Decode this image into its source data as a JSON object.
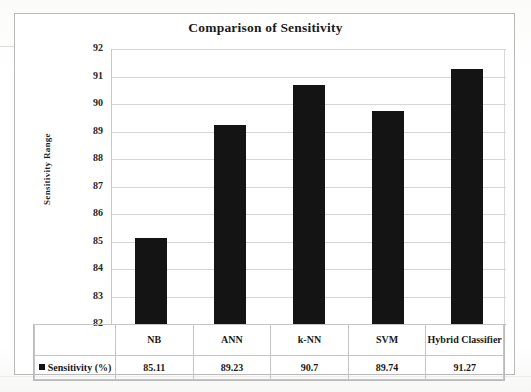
{
  "chart_data": {
    "type": "bar",
    "title": "Comparison of Sensitivity",
    "xlabel": "",
    "ylabel": "Sensitivity Range",
    "categories": [
      "NB",
      "ANN",
      "k-NN",
      "SVM",
      "Hybrid Classifier"
    ],
    "values": [
      85.11,
      89.23,
      90.7,
      89.74,
      91.27
    ],
    "value_labels": [
      "85.11",
      "89.23",
      "90.7",
      "89.74",
      "91.27"
    ],
    "series": [
      {
        "name": "Sensitivity (%)",
        "values": [
          85.11,
          89.23,
          90.7,
          89.74,
          91.27
        ]
      }
    ],
    "ylim": [
      82,
      92
    ],
    "ytick_labels": [
      "92",
      "91",
      "90",
      "89",
      "88",
      "87",
      "86",
      "85",
      "84",
      "83",
      "82"
    ],
    "ytick_values": [
      92,
      91,
      90,
      89,
      88,
      87,
      86,
      85,
      84,
      83,
      82
    ],
    "grid": true,
    "legend_position": "bottom-table",
    "bar_color": "#141414",
    "grid_color": "#d6d6d6",
    "frame_color": "#b9b9b9"
  },
  "legend": {
    "label": "Sensitivity (%)",
    "marker_color": "#141414"
  },
  "table": {
    "category_row": [
      "NB",
      "ANN",
      "k-NN",
      "SVM",
      "Hybrid Classifier"
    ],
    "value_row": [
      "85.11",
      "89.23",
      "90.7",
      "89.74",
      "91.27"
    ]
  }
}
